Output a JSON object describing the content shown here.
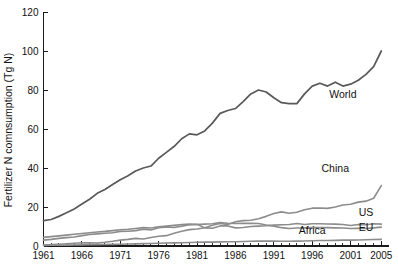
{
  "chart_data": {
    "type": "line",
    "title": "",
    "xlabel": "",
    "ylabel": "Fertilizer N comnsumption (Tg N)",
    "xlim": [
      1961,
      2006
    ],
    "ylim": [
      0,
      120
    ],
    "yticks": [
      0,
      20,
      40,
      60,
      80,
      100,
      120
    ],
    "xticks": [
      1961,
      1966,
      1971,
      1976,
      1981,
      1986,
      1991,
      1996,
      2001,
      2005
    ],
    "xtick_labels": [
      "1961",
      "1966",
      "1971",
      "1976",
      "1981",
      "1986",
      "1991",
      "1996",
      "2001",
      "2005"
    ],
    "ytick_labels": [
      "0",
      "20",
      "40",
      "60",
      "80",
      "100",
      "120"
    ],
    "grid": false,
    "legend_position": "inline-right",
    "minor_xticks_every": 1,
    "x": [
      1961,
      1962,
      1963,
      1964,
      1965,
      1966,
      1967,
      1968,
      1969,
      1970,
      1971,
      1972,
      1973,
      1974,
      1975,
      1976,
      1977,
      1978,
      1979,
      1980,
      1981,
      1982,
      1983,
      1984,
      1985,
      1986,
      1987,
      1988,
      1989,
      1990,
      1991,
      1992,
      1993,
      1994,
      1995,
      1996,
      1997,
      1998,
      1999,
      2000,
      2001,
      2002,
      2003,
      2004,
      2005
    ],
    "series": [
      {
        "name": "World",
        "color": "#595959",
        "label_x": 2000,
        "label_y": 76,
        "values": [
          13.0,
          13.6,
          15.2,
          17.0,
          19.0,
          21.5,
          24.0,
          27.0,
          29.0,
          31.5,
          34.0,
          36.0,
          38.5,
          40.0,
          41.0,
          45.0,
          48.0,
          51.0,
          55.0,
          57.5,
          57.0,
          59.0,
          63.0,
          68.0,
          69.5,
          70.5,
          74.0,
          78.0,
          80.0,
          79.0,
          76.0,
          73.5,
          73.0,
          73.0,
          78.0,
          82.0,
          83.5,
          82.0,
          84.0,
          82.0,
          83.0,
          85.0,
          88.0,
          92.0,
          100.0
        ]
      },
      {
        "name": "China",
        "color": "#8c8c8c",
        "label_x": 1999,
        "label_y": 38,
        "values": [
          0.6,
          0.7,
          0.9,
          1.1,
          1.4,
          1.7,
          1.6,
          1.5,
          1.9,
          2.4,
          3.0,
          3.4,
          3.9,
          3.6,
          4.4,
          5.0,
          5.3,
          6.5,
          7.6,
          8.4,
          8.7,
          9.4,
          10.6,
          11.5,
          11.0,
          12.4,
          13.0,
          13.2,
          14.0,
          15.2,
          16.7,
          17.5,
          16.8,
          17.3,
          18.6,
          19.4,
          19.5,
          19.3,
          20.0,
          21.0,
          21.4,
          22.5,
          23.0,
          24.5,
          31.0
        ]
      },
      {
        "name": "US",
        "color": "#8c8c8c",
        "label_x": 2003,
        "label_y": 15.5,
        "values": [
          3.0,
          3.4,
          3.9,
          4.3,
          4.6,
          5.3,
          5.9,
          6.2,
          6.5,
          6.8,
          7.5,
          7.6,
          7.9,
          8.6,
          8.2,
          9.4,
          9.8,
          9.5,
          10.2,
          10.9,
          11.1,
          9.3,
          9.1,
          10.3,
          10.3,
          9.3,
          9.5,
          10.0,
          10.2,
          10.4,
          10.7,
          10.9,
          11.0,
          11.5,
          11.0,
          11.4,
          11.4,
          11.3,
          11.2,
          11.0,
          10.5,
          11.0,
          10.9,
          11.4,
          11.2
        ]
      },
      {
        "name": "EU",
        "color": "#8c8c8c",
        "label_x": 2003,
        "label_y": 7.5,
        "values": [
          4.4,
          4.8,
          5.2,
          5.6,
          6.0,
          6.4,
          6.8,
          7.2,
          7.5,
          7.9,
          8.3,
          8.6,
          9.0,
          9.4,
          9.2,
          9.8,
          10.2,
          10.6,
          11.0,
          11.2,
          11.0,
          11.2,
          11.4,
          12.0,
          11.7,
          11.5,
          11.6,
          11.7,
          11.5,
          10.8,
          10.2,
          9.4,
          9.0,
          9.2,
          9.3,
          9.5,
          9.4,
          9.4,
          9.3,
          9.2,
          9.0,
          9.1,
          9.0,
          9.3,
          9.7
        ]
      },
      {
        "name": "Africa",
        "color": "#8c8c8c",
        "label_x": 1996,
        "label_y": 6.0,
        "values": [
          0.3,
          0.35,
          0.4,
          0.45,
          0.5,
          0.6,
          0.65,
          0.7,
          0.75,
          0.85,
          0.9,
          1.0,
          1.1,
          1.2,
          1.25,
          1.4,
          1.5,
          1.6,
          1.7,
          1.8,
          1.9,
          2.0,
          2.0,
          2.1,
          2.2,
          2.2,
          2.3,
          2.4,
          2.5,
          2.5,
          2.5,
          2.4,
          2.4,
          2.5,
          2.6,
          2.7,
          2.8,
          2.8,
          2.9,
          3.0,
          3.0,
          3.1,
          3.2,
          3.3,
          3.4
        ]
      }
    ]
  }
}
